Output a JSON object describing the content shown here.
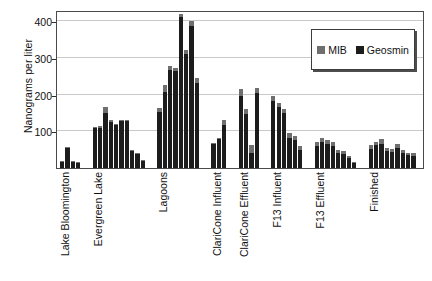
{
  "chart_data": {
    "type": "bar",
    "title": "",
    "subtitle": "",
    "xlabel": "",
    "ylabel": "Nanograms per liter",
    "ylim": [
      0,
      430
    ],
    "yticks": [
      100,
      200,
      300,
      400
    ],
    "ytick_labels": [
      "100",
      "200",
      "300",
      "400"
    ],
    "grid": true,
    "grid_axis": "y",
    "stacked": true,
    "legend_position": "top-right",
    "legend": [
      {
        "name": "MIB",
        "color": "#6f6f6f"
      },
      {
        "name": "Geosmin",
        "color": "#1c1c1c"
      }
    ],
    "categories": [
      "Lake Bloomington",
      "Evergreen Lake",
      "Lagoons",
      "ClariCone Influent",
      "ClariCone Effluent",
      "F13 Influent",
      "F13 Effluent",
      "Finished"
    ],
    "groups": [
      {
        "category": "Lake Bloomington",
        "bars": [
          {
            "total": 20,
            "geosmin": 17,
            "mib": 3
          },
          {
            "total": 57,
            "geosmin": 54,
            "mib": 3
          },
          {
            "total": 18,
            "geosmin": 16,
            "mib": 2
          },
          {
            "total": 17,
            "geosmin": 15,
            "mib": 2
          }
        ]
      },
      {
        "category": "Evergreen Lake",
        "bars": [
          {
            "total": 112,
            "geosmin": 108,
            "mib": 4
          },
          {
            "total": 113,
            "geosmin": 109,
            "mib": 4
          },
          {
            "total": 167,
            "geosmin": 150,
            "mib": 17
          },
          {
            "total": 130,
            "geosmin": 126,
            "mib": 4
          },
          {
            "total": 120,
            "geosmin": 116,
            "mib": 4
          },
          {
            "total": 131,
            "geosmin": 127,
            "mib": 4
          },
          {
            "total": 131,
            "geosmin": 127,
            "mib": 4
          },
          {
            "total": 48,
            "geosmin": 45,
            "mib": 3
          },
          {
            "total": 42,
            "geosmin": 39,
            "mib": 3
          },
          {
            "total": 22,
            "geosmin": 20,
            "mib": 2
          }
        ]
      },
      {
        "category": "Lagoons",
        "bars": [
          {
            "total": 163,
            "geosmin": 152,
            "mib": 11
          },
          {
            "total": 225,
            "geosmin": 208,
            "mib": 17
          },
          {
            "total": 278,
            "geosmin": 268,
            "mib": 10
          },
          {
            "total": 272,
            "geosmin": 264,
            "mib": 8
          },
          {
            "total": 420,
            "geosmin": 410,
            "mib": 10
          },
          {
            "total": 320,
            "geosmin": 310,
            "mib": 10
          },
          {
            "total": 400,
            "geosmin": 386,
            "mib": 14
          },
          {
            "total": 245,
            "geosmin": 232,
            "mib": 13
          }
        ]
      },
      {
        "category": "ClariCone Influent",
        "bars": [
          {
            "total": 68,
            "geosmin": 64,
            "mib": 4
          },
          {
            "total": 82,
            "geosmin": 78,
            "mib": 4
          },
          {
            "total": 130,
            "geosmin": 118,
            "mib": 12
          }
        ]
      },
      {
        "category": "ClariCone Effluent",
        "bars": [
          {
            "total": 216,
            "geosmin": 196,
            "mib": 20
          },
          {
            "total": 160,
            "geosmin": 148,
            "mib": 12
          },
          {
            "total": 62,
            "geosmin": 40,
            "mib": 22
          },
          {
            "total": 218,
            "geosmin": 204,
            "mib": 14
          }
        ]
      },
      {
        "category": "F13 Influent",
        "bars": [
          {
            "total": 196,
            "geosmin": 182,
            "mib": 14
          },
          {
            "total": 178,
            "geosmin": 166,
            "mib": 12
          },
          {
            "total": 160,
            "geosmin": 150,
            "mib": 10
          },
          {
            "total": 95,
            "geosmin": 82,
            "mib": 13
          },
          {
            "total": 88,
            "geosmin": 76,
            "mib": 12
          },
          {
            "total": 60,
            "geosmin": 50,
            "mib": 10
          }
        ]
      },
      {
        "category": "F13 Effluent",
        "bars": [
          {
            "total": 70,
            "geosmin": 60,
            "mib": 10
          },
          {
            "total": 82,
            "geosmin": 70,
            "mib": 12
          },
          {
            "total": 76,
            "geosmin": 66,
            "mib": 10
          },
          {
            "total": 70,
            "geosmin": 60,
            "mib": 10
          },
          {
            "total": 50,
            "geosmin": 42,
            "mib": 8
          },
          {
            "total": 46,
            "geosmin": 38,
            "mib": 8
          },
          {
            "total": 34,
            "geosmin": 28,
            "mib": 6
          },
          {
            "total": 17,
            "geosmin": 14,
            "mib": 3
          }
        ]
      },
      {
        "category": "Finished",
        "bars": [
          {
            "total": 62,
            "geosmin": 52,
            "mib": 10
          },
          {
            "total": 72,
            "geosmin": 62,
            "mib": 10
          },
          {
            "total": 78,
            "geosmin": 66,
            "mib": 12
          },
          {
            "total": 55,
            "geosmin": 46,
            "mib": 9
          },
          {
            "total": 52,
            "geosmin": 44,
            "mib": 8
          },
          {
            "total": 66,
            "geosmin": 54,
            "mib": 12
          },
          {
            "total": 48,
            "geosmin": 40,
            "mib": 8
          },
          {
            "total": 42,
            "geosmin": 35,
            "mib": 7
          },
          {
            "total": 40,
            "geosmin": 34,
            "mib": 6
          }
        ]
      }
    ]
  }
}
